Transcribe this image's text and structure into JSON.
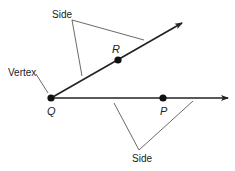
{
  "diagram": {
    "type": "angle",
    "labels": {
      "side_top": "Side",
      "side_bottom": "Side",
      "vertex": "Vertex",
      "point_q": "Q",
      "point_r": "R",
      "point_p": "P"
    },
    "colors": {
      "stroke": "#222222",
      "leader": "#444444"
    }
  }
}
